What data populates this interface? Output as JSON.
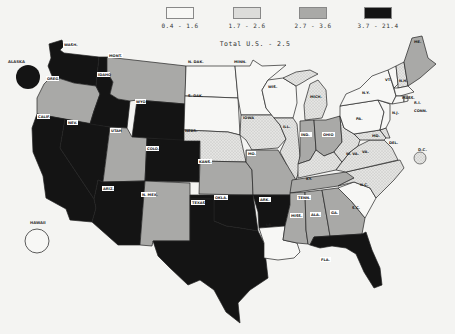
{
  "legend": {
    "classes": [
      {
        "label": "0.4 - 1.6",
        "color": "#f7f7f5",
        "pattern": "none"
      },
      {
        "label": "1.7 - 2.6",
        "color": "#dcdcda",
        "pattern": "stipple"
      },
      {
        "label": "2.7 - 3.6",
        "color": "#a9a9a7",
        "pattern": "none"
      },
      {
        "label": "3.7 - 21.4",
        "color": "#141414",
        "pattern": "none"
      }
    ],
    "total_label": "Total U.S. - 2.5"
  },
  "colors": {
    "c1": "#f7f7f5",
    "c2": "#dcdcda",
    "c3": "#a9a9a7",
    "c4": "#141414",
    "background": "#f4f4f2"
  },
  "insets": {
    "alaska": {
      "label": "ALASKA",
      "class": 4
    },
    "hawaii": {
      "label": "HAWAII",
      "class": 1
    },
    "dc": {
      "label": "D.C.",
      "class": 2
    }
  },
  "states": [
    {
      "abbr": "WASH.",
      "class": 4
    },
    {
      "abbr": "OREG.",
      "class": 3
    },
    {
      "abbr": "CALIF.",
      "class": 4
    },
    {
      "abbr": "IDAHO",
      "class": 4
    },
    {
      "abbr": "NEV.",
      "class": 4
    },
    {
      "abbr": "MONT.",
      "class": 3
    },
    {
      "abbr": "WYO.",
      "class": 4
    },
    {
      "abbr": "UTAH",
      "class": 3
    },
    {
      "abbr": "COLO.",
      "class": 4
    },
    {
      "abbr": "ARIZ.",
      "class": 4
    },
    {
      "abbr": "N. MEX.",
      "class": 3
    },
    {
      "abbr": "N. DAK.",
      "class": 1
    },
    {
      "abbr": "S. DAK.",
      "class": 1
    },
    {
      "abbr": "NEBR.",
      "class": 2
    },
    {
      "abbr": "KANS.",
      "class": 3
    },
    {
      "abbr": "OKLA.",
      "class": 4
    },
    {
      "abbr": "TEXAS",
      "class": 4
    },
    {
      "abbr": "MINN.",
      "class": 1
    },
    {
      "abbr": "IOWA",
      "class": 2
    },
    {
      "abbr": "MO.",
      "class": 3
    },
    {
      "abbr": "ARK.",
      "class": 4
    },
    {
      "abbr": "LA.",
      "class": 1
    },
    {
      "abbr": "WIS.",
      "class": 1
    },
    {
      "abbr": "ILL.",
      "class": 2
    },
    {
      "abbr": "MICH.",
      "class": 2
    },
    {
      "abbr": "IND.",
      "class": 3
    },
    {
      "abbr": "OHIO",
      "class": 3
    },
    {
      "abbr": "KY.",
      "class": 2
    },
    {
      "abbr": "TENN.",
      "class": 3
    },
    {
      "abbr": "MISS.",
      "class": 3
    },
    {
      "abbr": "ALA.",
      "class": 3
    },
    {
      "abbr": "GA.",
      "class": 3
    },
    {
      "abbr": "FLA.",
      "class": 4
    },
    {
      "abbr": "S.C.",
      "class": 1
    },
    {
      "abbr": "N.C.",
      "class": 2
    },
    {
      "abbr": "VA.",
      "class": 2
    },
    {
      "abbr": "W. VA.",
      "class": 2
    },
    {
      "abbr": "MD.",
      "class": 2
    },
    {
      "abbr": "DEL.",
      "class": 2
    },
    {
      "abbr": "PA.",
      "class": 1
    },
    {
      "abbr": "N.J.",
      "class": 1
    },
    {
      "abbr": "N.Y.",
      "class": 1
    },
    {
      "abbr": "CONN.",
      "class": 1
    },
    {
      "abbr": "R.I.",
      "class": 1
    },
    {
      "abbr": "MASS.",
      "class": 1
    },
    {
      "abbr": "VT.",
      "class": 1
    },
    {
      "abbr": "N.H.",
      "class": 2
    },
    {
      "abbr": "ME.",
      "class": 3
    }
  ]
}
